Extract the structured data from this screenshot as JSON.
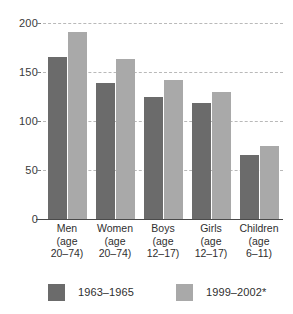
{
  "chart_data": {
    "type": "bar",
    "title": "",
    "subtitle": "",
    "xlabel": "",
    "ylabel": "",
    "ylim": [
      0,
      200
    ],
    "yticks": [
      0,
      50,
      100,
      150,
      200
    ],
    "ytick_labels": [
      "0",
      "50",
      "100",
      "150",
      "200"
    ],
    "grid": true,
    "grid_axis": "y",
    "grid_style": "dashed",
    "legend_position": "bottom",
    "categories": [
      "Men\n(age\n20–74)",
      "Women\n(age\n20–74)",
      "Boys\n(age\n12–17)",
      "Girls\n(age\n12–17)",
      "Children\n(age\n6–11)"
    ],
    "category_names": [
      "Men",
      "Women",
      "Boys",
      "Girls",
      "Children"
    ],
    "category_age_ranges": [
      "(age 20–74)",
      "(age 20–74)",
      "(age 12–17)",
      "(age 12–17)",
      "(age 6–11)"
    ],
    "series": [
      {
        "name": "1963–1965",
        "color": "#6b6b6b",
        "values": [
          165,
          139,
          125,
          118,
          65
        ]
      },
      {
        "name": "1999–2002*",
        "color": "#a9a9a9",
        "values": [
          191,
          163,
          142,
          130,
          74
        ]
      }
    ],
    "footnote_marker": "*"
  },
  "axis": {
    "tick_200": "200",
    "tick_150": "150",
    "tick_100": "100",
    "tick_50": "50",
    "tick_0": "0"
  },
  "legend": {
    "item0_label": "1963–1965",
    "item1_label": "1999–2002*"
  },
  "colors": {
    "series0": "#6b6b6b",
    "series1": "#a9a9a9",
    "grid": "#b9b9b9",
    "axis": "#4a4a4a",
    "background": "#ffffff",
    "text": "#2f2f2f"
  }
}
